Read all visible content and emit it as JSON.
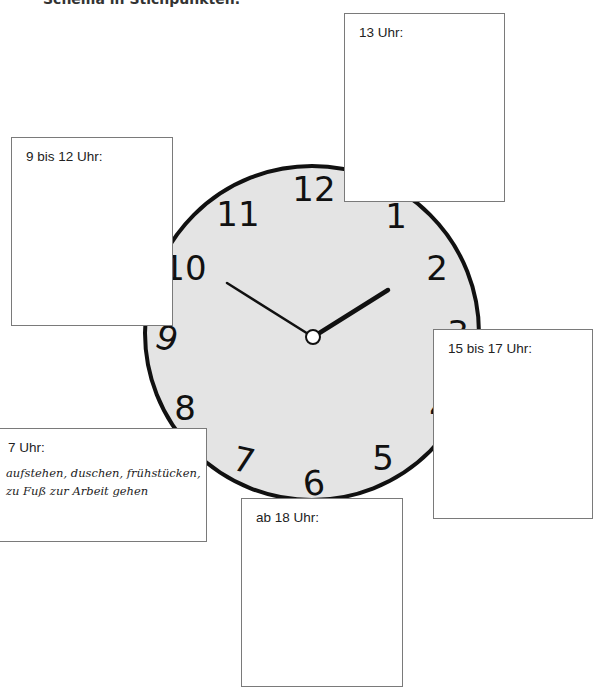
{
  "heading": "Schema in Stichpunkten.",
  "clock": {
    "face_color": "#e4e4e4",
    "rim_color": "#111111",
    "numerals": [
      "12",
      "1",
      "2",
      "3",
      "4",
      "5",
      "6",
      "7",
      "8",
      "9",
      "10",
      "11"
    ],
    "time_shown": "10:10",
    "hour_hand": "pointing between 1 and 2",
    "minute_hand": "pointing at 10"
  },
  "boxes": {
    "b13": {
      "label": "13 Uhr:"
    },
    "b9_12": {
      "label": "9 bis 12 Uhr:"
    },
    "b15_17": {
      "label": "15 bis 17 Uhr:"
    },
    "b7": {
      "label": "7 Uhr:",
      "note_line1": "aufstehen, duschen, frühstücken,",
      "note_line2": "zu Fuß zur Arbeit gehen"
    },
    "b18": {
      "label": "ab 18 Uhr:"
    }
  }
}
